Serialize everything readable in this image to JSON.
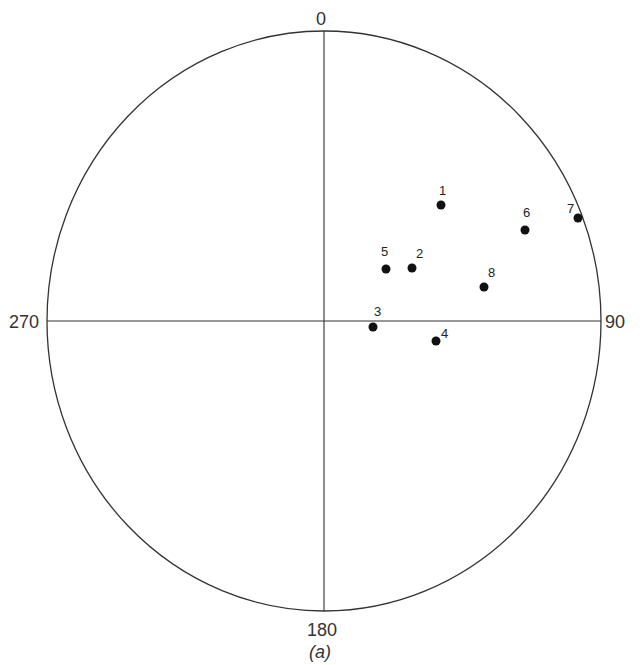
{
  "chart_data": {
    "type": "scatter",
    "subtype": "polar-stereonet",
    "title": "",
    "caption": "(a)",
    "axis_labels": {
      "top": "0",
      "right": "90",
      "bottom": "180",
      "left": "270"
    },
    "grid": false,
    "circle": {
      "cx": 324,
      "cy": 321,
      "rx": 277,
      "ry": 290
    },
    "points": [
      {
        "label": "1",
        "x": 441,
        "y": 205,
        "label_dx": -2,
        "label_dy": -10
      },
      {
        "label": "2",
        "x": 412,
        "y": 268,
        "label_dx": 4,
        "label_dy": -10
      },
      {
        "label": "3",
        "x": 373,
        "y": 327,
        "label_dx": 1,
        "label_dy": -11
      },
      {
        "label": "4",
        "x": 436,
        "y": 341,
        "label_dx": 5,
        "label_dy": -3
      },
      {
        "label": "5",
        "x": 386,
        "y": 269,
        "label_dx": -5,
        "label_dy": -13
      },
      {
        "label": "6",
        "x": 525,
        "y": 230,
        "label_dx": -2,
        "label_dy": -13
      },
      {
        "label": "7",
        "x": 578,
        "y": 218,
        "label_dx": -11,
        "label_dy": -5
      },
      {
        "label": "8",
        "x": 484,
        "y": 287,
        "label_dx": 4,
        "label_dy": -10
      }
    ]
  }
}
